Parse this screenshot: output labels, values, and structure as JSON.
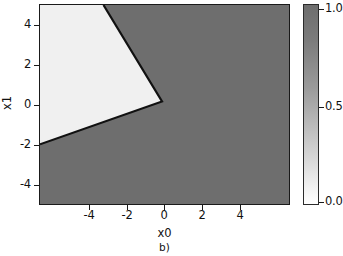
{
  "figure": {
    "caption": "b)",
    "background": "#ffffff"
  },
  "axes": {
    "xlabel": "x0",
    "ylabel": "x1",
    "xticks": [
      "-4",
      "-2",
      "0",
      "2",
      "4"
    ],
    "yticks": [
      "4",
      "2",
      "0",
      "-2",
      "-4"
    ],
    "xtick_values": [
      -4,
      -2,
      0,
      2,
      4
    ],
    "ytick_values": [
      4,
      2,
      0,
      -2,
      -4
    ],
    "xlim": [
      -5,
      5
    ],
    "ylim": [
      -5,
      5
    ]
  },
  "colorbar": {
    "ticks": [
      "1.0",
      "0.5",
      "0.0"
    ],
    "tick_values": [
      1.0,
      0.5,
      0.0
    ],
    "vmin": 0.0,
    "vmax": 1.0,
    "color_low": "#ffffff",
    "color_high": "#6e6e6e"
  },
  "colors": {
    "region_low": "#f0f0f0",
    "region_high": "#6e6e6e",
    "boundary": "#111111",
    "axis": "#1a1a1a"
  },
  "chart_data": {
    "type": "heatmap",
    "title": "",
    "subtitle": "",
    "xlabel": "x0",
    "ylabel": "x1",
    "xlim": [
      -5,
      5
    ],
    "ylim": [
      -5,
      5
    ],
    "xticks": [
      -4,
      -2,
      0,
      2,
      4
    ],
    "yticks": [
      -4,
      -2,
      0,
      2,
      4
    ],
    "grid": false,
    "legend": "colorbar-right",
    "colorbar": {
      "vmin": 0.0,
      "vmax": 1.0,
      "ticks": [
        0.0,
        0.5,
        1.0
      ],
      "colormap": "white-to-gray"
    },
    "regions": [
      {
        "label": "low",
        "value": 0.0,
        "fill": "#f0f0f0",
        "polygon_xy": [
          [
            -5,
            5
          ],
          [
            -2.45,
            5
          ],
          [
            -0.1,
            0.15
          ],
          [
            -5,
            -2.0
          ]
        ]
      },
      {
        "label": "high",
        "value": 1.0,
        "fill": "#6e6e6e",
        "polygon_xy": [
          [
            -2.45,
            5
          ],
          [
            5,
            5
          ],
          [
            5,
            -5
          ],
          [
            -5,
            -5
          ],
          [
            -5,
            -2.0
          ],
          [
            -0.1,
            0.15
          ]
        ]
      }
    ],
    "boundary_segments": [
      {
        "name": "upper-segment",
        "from_xy": [
          -2.45,
          5.0
        ],
        "to_xy": [
          -0.1,
          0.15
        ],
        "slope": -2.06,
        "intercept": -0.06
      },
      {
        "name": "lower-segment",
        "from_xy": [
          -0.1,
          0.15
        ],
        "to_xy": [
          -5.0,
          -2.0
        ],
        "slope": 0.439,
        "intercept": 0.194
      }
    ],
    "vertex_xy": [
      -0.1,
      0.15
    ]
  }
}
